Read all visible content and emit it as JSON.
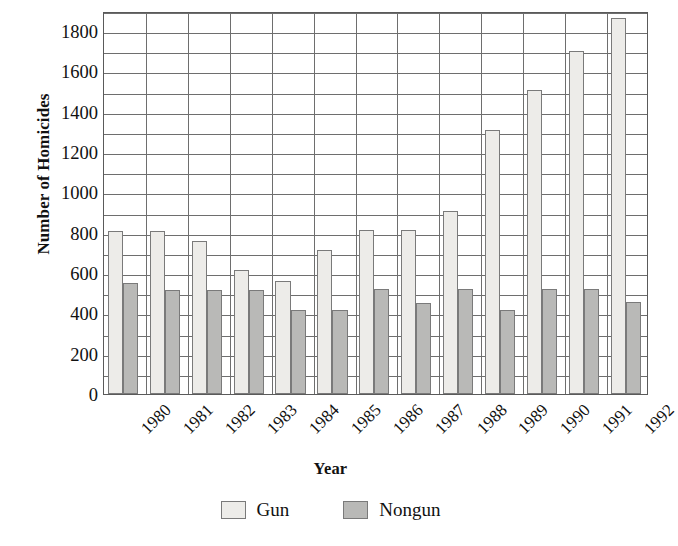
{
  "chart_data": {
    "type": "bar",
    "title": "",
    "xlabel": "Year",
    "ylabel": "Number of Homicides",
    "categories": [
      "1980",
      "1981",
      "1982",
      "1983",
      "1984",
      "1985",
      "1986",
      "1987",
      "1988",
      "1989",
      "1990",
      "1991",
      "1992"
    ],
    "series": [
      {
        "name": "Gun",
        "color": "#edece9",
        "values": [
          810,
          810,
          760,
          615,
          560,
          715,
          815,
          815,
          910,
          1310,
          1510,
          1700,
          1865
        ]
      },
      {
        "name": "Nongun",
        "color": "#b9b9b7",
        "values": [
          550,
          515,
          515,
          515,
          415,
          415,
          520,
          450,
          520,
          415,
          520,
          520,
          455
        ]
      }
    ],
    "ylim": [
      0,
      1900
    ],
    "y_ticks": [
      0,
      200,
      400,
      600,
      800,
      1000,
      1200,
      1400,
      1600,
      1800
    ],
    "y_minor_step": 100,
    "grid": true,
    "grid_horizontal": true,
    "grid_vertical": true,
    "legend_position": "bottom"
  },
  "axes": {
    "y_title": "Number of Homicides",
    "x_title": "Year"
  },
  "legend": {
    "entries": [
      {
        "label": "Gun",
        "swatch": "legend-swatch-gun"
      },
      {
        "label": "Nongun",
        "swatch": "legend-swatch-nongun"
      }
    ]
  },
  "colors": {
    "gun": "#edece9",
    "nongun": "#b9b9b7",
    "grid": "#6e6e6e",
    "axis": "#5a5a5a",
    "text": "#111111",
    "background": "#ffffff"
  }
}
